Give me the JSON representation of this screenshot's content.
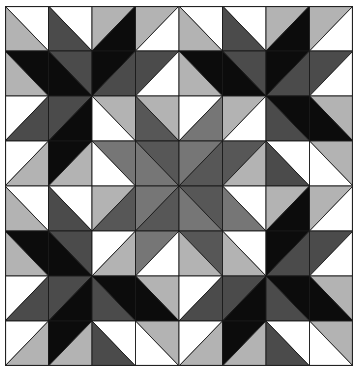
{
  "grid": {
    "cols": 8,
    "rows": 8,
    "cell_w": 43.5,
    "cell_h": 45
  },
  "colors": {
    "W": "#ffffff",
    "LG": "#b3b3b3",
    "DG": "#4b4b4b",
    "BK": "#0c0c0c",
    "M1": "#575757",
    "M2": "#767676"
  },
  "base_tile": [
    [
      [
        "\\",
        "W",
        "LG"
      ],
      [
        "\\",
        "W",
        "DG"
      ],
      [
        "/",
        "LG",
        "BK"
      ],
      [
        "/",
        "LG",
        "W"
      ]
    ],
    [
      [
        "\\",
        "BK",
        "LG"
      ],
      [
        "\\",
        "DG",
        "BK"
      ],
      [
        "/",
        "BK",
        "DG"
      ],
      [
        "/",
        "DG",
        "W"
      ]
    ],
    [
      [
        "/",
        "W",
        "DG"
      ],
      [
        "/",
        "DG",
        "BK"
      ],
      [
        "\\",
        "BK",
        "DG"
      ],
      [
        "\\",
        "LG",
        "BK"
      ]
    ],
    [
      [
        "/",
        "W",
        "LG"
      ],
      [
        "/",
        "BK",
        "LG"
      ],
      [
        "\\",
        "W",
        "DG"
      ],
      [
        "\\",
        "LG",
        "W"
      ]
    ]
  ],
  "center_override": {
    "origin": [
      2,
      2
    ],
    "cells": [
      [
        [
          "\\",
          "LG",
          "W"
        ],
        [
          "\\",
          "LG",
          "M1"
        ],
        [
          "/",
          "W",
          "M2"
        ],
        [
          "/",
          "LG",
          "W"
        ]
      ],
      [
        [
          "\\",
          "M2",
          "W"
        ],
        [
          "\\",
          "M1",
          "M2"
        ],
        [
          "/",
          "M2",
          "M1"
        ],
        [
          "/",
          "M1",
          "LG"
        ]
      ],
      [
        [
          "/",
          "LG",
          "M1"
        ],
        [
          "/",
          "M2",
          "M1"
        ],
        [
          "\\",
          "M1",
          "M2"
        ],
        [
          "\\",
          "W",
          "M2"
        ]
      ],
      [
        [
          "/",
          "W",
          "LG"
        ],
        [
          "/",
          "M2",
          "W"
        ],
        [
          "\\",
          "M1",
          "LG"
        ],
        [
          "\\",
          "W",
          "LG"
        ]
      ]
    ]
  }
}
